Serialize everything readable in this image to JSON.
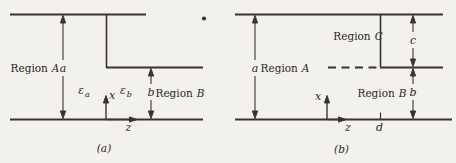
{
  "palette": {
    "background": "#f3f1ed",
    "ink": "#38342f",
    "text": "#2b2826"
  },
  "figure_a": {
    "caption": "(a)",
    "region_a": {
      "word": "Region",
      "letter": "A"
    },
    "region_b": {
      "word": "Region",
      "letter": "B"
    },
    "dim_a": "a",
    "dim_b": "b",
    "eps_a": {
      "symbol": "ε",
      "sub": "a"
    },
    "eps_b": {
      "symbol": "ε",
      "sub": "b"
    },
    "axis_x": "x",
    "axis_z": "z"
  },
  "figure_b": {
    "caption": "(b)",
    "region_a": {
      "word": "Region",
      "letter": "A"
    },
    "region_b": {
      "word": "Region",
      "letter": "B"
    },
    "region_c": {
      "word": "Region",
      "letter": "C"
    },
    "dim_a": "a",
    "dim_b": "b",
    "dim_c": "c",
    "dim_d": "d",
    "axis_x": "x",
    "axis_z": "z"
  }
}
